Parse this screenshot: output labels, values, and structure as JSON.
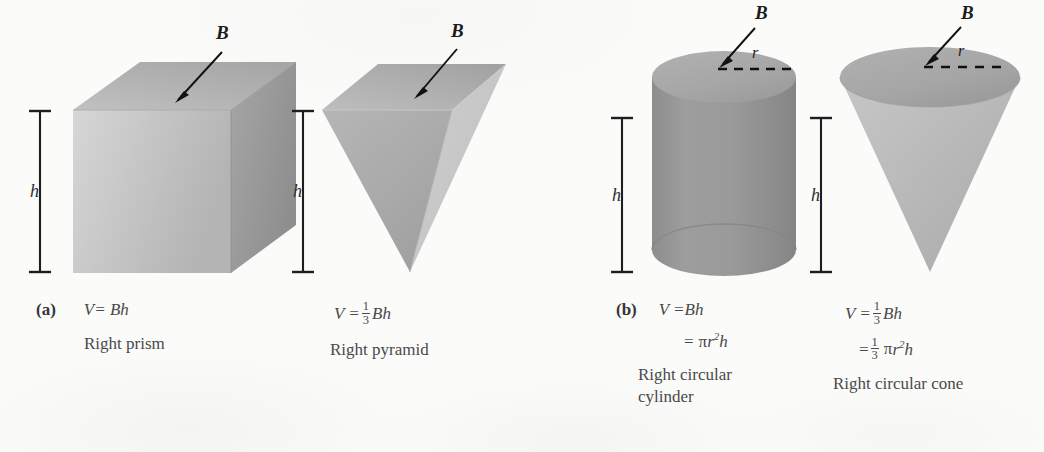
{
  "figure": {
    "background_color": "#fbfbfa",
    "ink_color": "#4a4a4a"
  },
  "parts": {
    "a_label": "(a)",
    "b_label": "(b)"
  },
  "labels": {
    "base_B": "B",
    "height_h": "h",
    "radius_r": "r"
  },
  "shapes": [
    {
      "id": "right-prism",
      "name": "Right prism",
      "part": "(a)",
      "base_label": "B",
      "height_label": "h",
      "formula_lines": [
        "V = Bh"
      ],
      "fill_top": "#b6b6b6",
      "fill_front": "#c9c9c9",
      "fill_side": "#9d9d9d"
    },
    {
      "id": "right-pyramid",
      "name": "Right pyramid",
      "part": "",
      "base_label": "B",
      "height_label": "h",
      "formula_lines": [
        "V = 1/3 Bh"
      ],
      "fill_top": "#b0b0b0",
      "fill_front": "#adadad",
      "fill_side": "#cfcfcf"
    },
    {
      "id": "right-circular-cylinder",
      "name": "Right circular cylinder",
      "part": "(b)",
      "base_label": "B",
      "height_label": "h",
      "radius_label": "r",
      "formula_lines": [
        "V = Bh",
        "= πr²h"
      ],
      "fill_top": "#a8a8a8",
      "fill_body": "#9a9a9a"
    },
    {
      "id": "right-circular-cone",
      "name": "Right circular cone",
      "part": "",
      "base_label": "B",
      "height_label": "h",
      "radius_label": "r",
      "formula_lines": [
        "V = 1/3 Bh",
        "= 1/3 πr²h"
      ],
      "fill_top": "#a6a6a6",
      "fill_body": "#bcbcbc"
    }
  ],
  "captions": {
    "prism": {
      "part": "(a)",
      "formula": "V= Bh",
      "name": "Right prism"
    },
    "pyramid": {
      "formula_v": "V =",
      "frac_num": "1",
      "frac_den": "3",
      "formula_tail": "Bh",
      "name": "Right pyramid"
    },
    "cylinder": {
      "part": "(b)",
      "formula1": "V =Bh",
      "formula2_eq": "=",
      "formula2_pi": "π",
      "formula2_r": "r",
      "formula2_sup": "2",
      "formula2_h": "h",
      "name_line1": "Right circular",
      "name_line2": "cylinder"
    },
    "cone": {
      "formula1_v": "V =",
      "frac1_num": "1",
      "frac1_den": "3",
      "formula1_tail": "Bh",
      "formula2_eq": "=",
      "frac2_num": "1",
      "frac2_den": "3",
      "formula2_pi": "π",
      "formula2_r": "r",
      "formula2_sup": "2",
      "formula2_h": "h",
      "name": "Right circular cone"
    }
  }
}
